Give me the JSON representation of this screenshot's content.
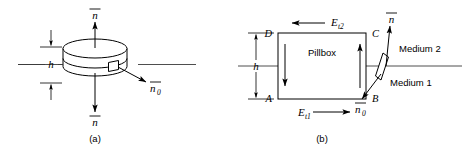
{
  "figure": {
    "panels": [
      {
        "id": "a",
        "caption": "(a)",
        "name": "pillbox-cylinder-3d",
        "labels": {
          "normal_top": "n",
          "normal_bottom": "n",
          "normal_side": "n",
          "normal_side_subscript": "0",
          "height": "h"
        }
      },
      {
        "id": "b",
        "caption": "(b)",
        "name": "pillbox-cross-section",
        "labels": {
          "box_label": "Pillbox",
          "corner_top_left": "D",
          "corner_top_right": "C",
          "corner_bottom_left": "A",
          "corner_bottom_right": "B",
          "height": "h",
          "field_top": "E",
          "field_top_subscript": "t2",
          "field_bottom": "E",
          "field_bottom_subscript": "t1",
          "medium_upper": "Medium 2",
          "medium_lower": "Medium 1",
          "normal_surface": "n",
          "normal_tangent": "n",
          "normal_tangent_subscript": "0"
        }
      }
    ]
  },
  "colors": {
    "ink": "#000000",
    "interface_line": "#3a3a3a",
    "background": "#ffffff"
  }
}
